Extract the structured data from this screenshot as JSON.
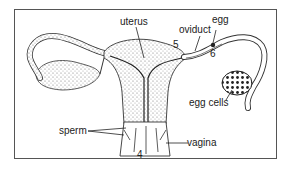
{
  "diagram": {
    "type": "anatomical-illustration",
    "labels": {
      "uterus": "uterus",
      "oviduct": "oviduct",
      "egg": "egg",
      "egg_cells": "egg cells",
      "sperm": "sperm",
      "vagina": "vagina",
      "num4": "4",
      "num5": "5",
      "num6": "6"
    },
    "colors": {
      "line": "#222222",
      "stipple": "#888888",
      "frame": "#555555"
    }
  }
}
